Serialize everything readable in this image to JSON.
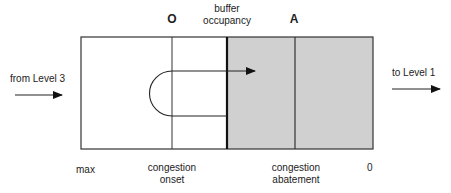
{
  "diagram": {
    "markers": {
      "onset_letter": "O",
      "abatement_letter": "A"
    },
    "top_labels": {
      "buffer_occupancy_line1": "buffer",
      "buffer_occupancy_line2": "occupancy"
    },
    "side_labels": {
      "input": "from Level 3",
      "output": "to Level 1"
    },
    "bottom_labels": {
      "max": "max",
      "onset_line1": "congestion",
      "onset_line2": "onset",
      "abatement_line1": "congestion",
      "abatement_line2": "abatement",
      "zero": "0"
    },
    "colors": {
      "shaded_region": "#d0d0d0",
      "lines": "#333333"
    }
  }
}
